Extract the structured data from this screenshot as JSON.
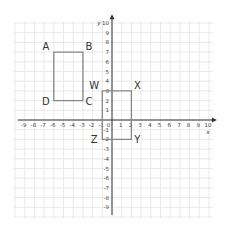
{
  "chart_data": {
    "type": "coordinate-grid",
    "title": "",
    "xlabel": "x",
    "ylabel": "y",
    "xlim": [
      -9,
      10
    ],
    "ylim": [
      -9,
      10
    ],
    "x_ticks": [
      -9,
      -8,
      -7,
      -6,
      -5,
      -4,
      -3,
      -2,
      -1,
      0,
      1,
      2,
      3,
      4,
      5,
      6,
      7,
      8,
      9,
      10
    ],
    "y_ticks": [
      10,
      9,
      8,
      7,
      6,
      5,
      4,
      3,
      2,
      1,
      -1,
      -2,
      -3,
      -4,
      -5,
      -6,
      -7,
      -8,
      -9
    ],
    "grid": true,
    "shapes": [
      {
        "name": "ABCD",
        "type": "rectangle",
        "vertices": [
          {
            "label": "A",
            "x": -6,
            "y": 7
          },
          {
            "label": "B",
            "x": -3,
            "y": 7
          },
          {
            "label": "C",
            "x": -3,
            "y": 2
          },
          {
            "label": "D",
            "x": -6,
            "y": 2
          }
        ]
      },
      {
        "name": "WXYZ",
        "type": "rectangle",
        "vertices": [
          {
            "label": "W",
            "x": -1,
            "y": 3
          },
          {
            "label": "X",
            "x": 2,
            "y": 3
          },
          {
            "label": "Y",
            "x": 2,
            "y": -2
          },
          {
            "label": "Z",
            "x": -1,
            "y": -2
          }
        ]
      }
    ]
  },
  "axes": {
    "x_label": "x",
    "y_label": "y"
  },
  "colors": {
    "grid": "#e4e4e4",
    "axis": "#333333",
    "shape_stroke": "#888888"
  }
}
